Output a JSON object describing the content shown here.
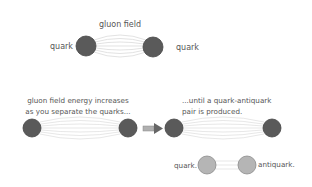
{
  "colors": {
    "quark_dark": "#5a5a5a",
    "quark_dark_stroke": "#454545",
    "quark_light": "#b5b5b5",
    "quark_light_stroke": "#8a8a8a",
    "field_line": "#d6d6d6",
    "arrow": "#9a9a9a",
    "text": "#555555"
  },
  "panel_top": {
    "field_label": "gluon field",
    "left_label": "quark",
    "right_label": "quark"
  },
  "panel_stretch": {
    "caption_line1": "gluon field energy increases",
    "caption_line2": "as you separate the quarks..."
  },
  "arrow": {
    "icon": "right-arrow-icon"
  },
  "panel_break": {
    "caption_line1": "...until a quark-antiquark",
    "caption_line2": "pair is produced."
  },
  "pair": {
    "left_label": "quark.",
    "right_label": "antiquark."
  }
}
